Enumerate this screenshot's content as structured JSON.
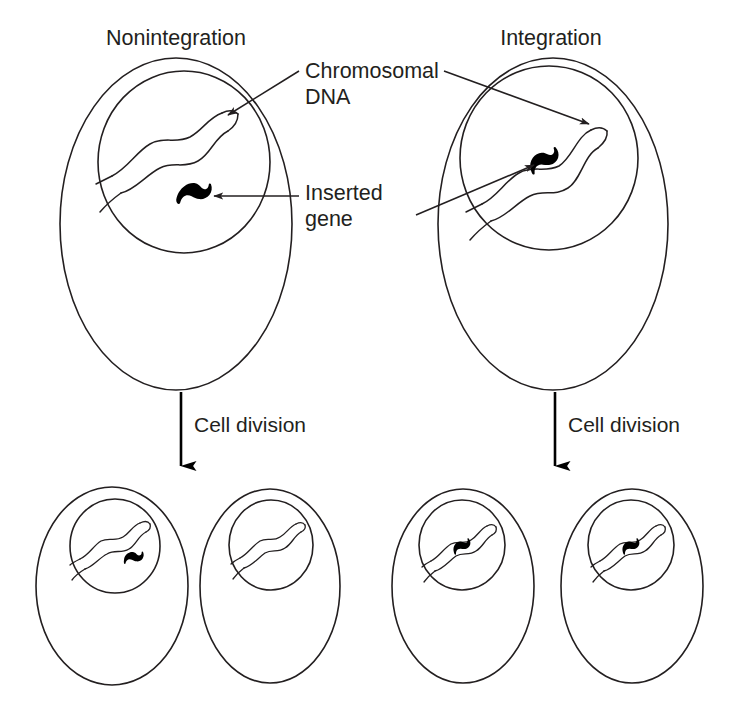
{
  "figure": {
    "type": "diagram",
    "background_color": "#ffffff",
    "ink_color": "#231f20",
    "gene_color": "#000000"
  },
  "labels": {
    "panel_left_title": "Nonintegration",
    "panel_right_title": "Integration",
    "chromosomal_dna_line1": "Chromosomal",
    "chromosomal_dna_line2": "DNA",
    "inserted_gene_line1": "Inserted",
    "inserted_gene_line2": "gene",
    "cell_division_left": "Cell division",
    "cell_division_right": "Cell division"
  },
  "panels": [
    {
      "id": "nonintegration",
      "title": "Nonintegration",
      "parent_cell": {
        "name": "parent-cell-nonintegration",
        "has_nucleus": true,
        "chromosomal_dna": true,
        "inserted_gene_free_in_nucleus": true,
        "inserted_gene_integrated": false
      },
      "daughter_cells": [
        {
          "name": "daughter-cell-left",
          "has_inserted_gene": true,
          "gene_integrated": false
        },
        {
          "name": "daughter-cell-right",
          "has_inserted_gene": false,
          "gene_integrated": false
        }
      ]
    },
    {
      "id": "integration",
      "title": "Integration",
      "parent_cell": {
        "name": "parent-cell-integration",
        "has_nucleus": true,
        "chromosomal_dna": true,
        "inserted_gene_free_in_nucleus": false,
        "inserted_gene_integrated": true
      },
      "daughter_cells": [
        {
          "name": "daughter-cell-left",
          "has_inserted_gene": true,
          "gene_integrated": true
        },
        {
          "name": "daughter-cell-right",
          "has_inserted_gene": true,
          "gene_integrated": true
        }
      ]
    }
  ],
  "annotations": [
    {
      "name": "chromosomal-dna-annotation",
      "text_line1": "Chromosomal",
      "text_line2": "DNA",
      "points_to": [
        "nonintegration-parent-dna",
        "integration-parent-dna"
      ]
    },
    {
      "name": "inserted-gene-annotation",
      "text_line1": "Inserted",
      "text_line2": "gene",
      "points_to": [
        "nonintegration-parent-gene",
        "integration-parent-gene"
      ]
    }
  ],
  "process_arrows": [
    {
      "name": "cell-division-arrow-left",
      "label": "Cell division",
      "direction": "down"
    },
    {
      "name": "cell-division-arrow-right",
      "label": "Cell division",
      "direction": "down"
    }
  ]
}
